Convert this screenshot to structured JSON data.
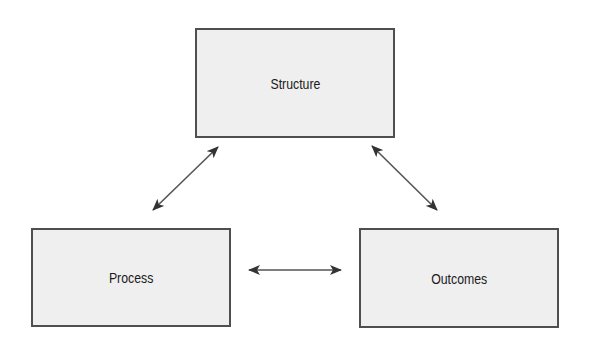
{
  "diagram": {
    "type": "triangle-relationship",
    "nodes": [
      {
        "id": "structure",
        "label": "Structure"
      },
      {
        "id": "process",
        "label": "Process"
      },
      {
        "id": "outcomes",
        "label": "Outcomes"
      }
    ],
    "edges": [
      {
        "from": "structure",
        "to": "process",
        "direction": "bidirectional"
      },
      {
        "from": "structure",
        "to": "outcomes",
        "direction": "bidirectional"
      },
      {
        "from": "process",
        "to": "outcomes",
        "direction": "bidirectional"
      }
    ],
    "colors": {
      "node_fill": "#efefef",
      "node_border": "#4f4f4f",
      "text": "#1a1a1a",
      "arrow": "#444444"
    }
  }
}
